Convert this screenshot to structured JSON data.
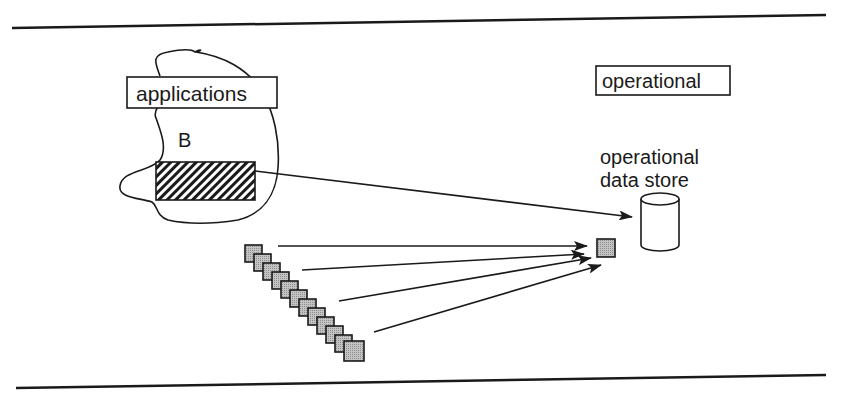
{
  "diagram": {
    "labels": {
      "applications": "applications",
      "b": "B",
      "operational": "operational",
      "ods_line1": "operational",
      "ods_line2": "data store"
    },
    "elements": {
      "source_blocks_count": 12,
      "arrows_from_stack": 4,
      "arrow_from_application": 1
    },
    "colors": {
      "line": "#1a1a1a",
      "block_fill": "#b5b5b5",
      "background": "#ffffff"
    }
  }
}
